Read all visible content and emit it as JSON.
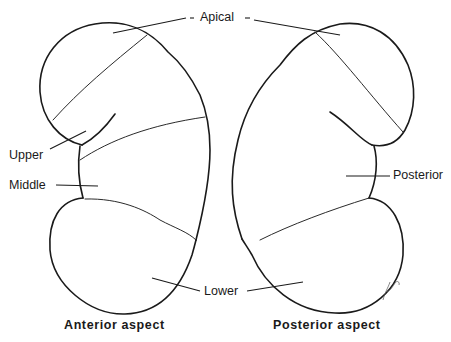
{
  "diagram": {
    "labels": {
      "apical": "Apical",
      "upper": "Upper",
      "middle": "Middle",
      "lower": "Lower",
      "posterior": "Posterior"
    },
    "captions": {
      "left": "Anterior aspect",
      "right": "Posterior aspect"
    },
    "colors": {
      "line": "#1a1a1a",
      "background": "#ffffff"
    }
  }
}
